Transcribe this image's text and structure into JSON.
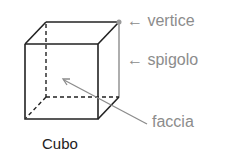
{
  "diagram": {
    "title": "Cubo",
    "labels": {
      "vertex": "← vertice",
      "edge": "← spigolo",
      "face": "faccia"
    },
    "colors": {
      "edge": "#222222",
      "label": "#8c8c8c",
      "highlight": "#9a9a9a"
    }
  }
}
